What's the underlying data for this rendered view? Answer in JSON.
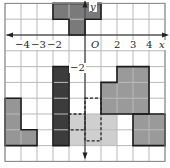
{
  "grid": {
    "x_min": -5,
    "x_max": 5,
    "y_min": -8,
    "y_max": 2,
    "origin_px": [
      85,
      35
    ],
    "cell_w": 16,
    "cell_h": 15.8,
    "line_color": "#b8b8b8",
    "border_color": "#888888"
  },
  "axes": {
    "x_label": "x",
    "y_label": "y",
    "origin_label": "O",
    "x_ticks": [
      {
        "value": -4,
        "label": "−4"
      },
      {
        "value": -3,
        "label": "−3"
      },
      {
        "value": -2,
        "label": "−2"
      },
      {
        "value": 2,
        "label": "2"
      },
      {
        "value": 3,
        "label": "3"
      },
      {
        "value": 4,
        "label": "4"
      }
    ],
    "y_ticks": [
      {
        "value": -2,
        "label": "−2"
      }
    ]
  },
  "colors": {
    "dark": "#4a4a4a",
    "medium": "#8e8e8e",
    "light": "#c9c9c9",
    "outline": "#1a1a1a"
  },
  "shapes": [
    {
      "name": "top-t-shape",
      "fill": "#7a7a7a",
      "cells": [
        [
          -2,
          1
        ],
        [
          -1,
          1
        ],
        [
          0,
          1
        ],
        [
          -1,
          0
        ]
      ]
    },
    {
      "name": "dark-bar",
      "fill": "#3c3c3c",
      "cells": [
        [
          -2,
          -3
        ],
        [
          -2,
          -4
        ],
        [
          -2,
          -5
        ],
        [
          -2,
          -6
        ],
        [
          -2,
          -7
        ]
      ]
    },
    {
      "name": "left-l-shape",
      "fill": "#969696",
      "cells": [
        [
          -5,
          -5
        ],
        [
          -5,
          -6
        ],
        [
          -5,
          -7
        ],
        [
          -4,
          -7
        ]
      ]
    },
    {
      "name": "right-medium-shape",
      "fill": "#9a9a9a",
      "cells": [
        [
          2,
          -3
        ],
        [
          3,
          -3
        ],
        [
          3,
          -4
        ],
        [
          1,
          -4
        ],
        [
          2,
          -4
        ],
        [
          1,
          -5
        ],
        [
          2,
          -5
        ],
        [
          3,
          -5
        ]
      ]
    },
    {
      "name": "bottom-right-square",
      "fill": "#9a9a9a",
      "cells": [
        [
          3,
          -6
        ],
        [
          4,
          -6
        ],
        [
          3,
          -7
        ],
        [
          4,
          -7
        ]
      ]
    },
    {
      "name": "light-region",
      "fill": "#cfcfcf",
      "outline": false,
      "cells": [
        [
          -1,
          -6
        ],
        [
          0,
          -6
        ],
        [
          1,
          -6
        ],
        [
          -1,
          -7
        ],
        [
          0,
          -7
        ],
        [
          1,
          -7
        ]
      ]
    }
  ],
  "dashed_outline": {
    "name": "dashed-shape",
    "points": [
      [
        0,
        -4
      ],
      [
        1,
        -4
      ],
      [
        1,
        -6.7
      ],
      [
        0,
        -6.7
      ],
      [
        0,
        -5
      ],
      [
        -1,
        -5
      ],
      [
        -1,
        -6
      ],
      [
        0,
        -6
      ]
    ]
  }
}
